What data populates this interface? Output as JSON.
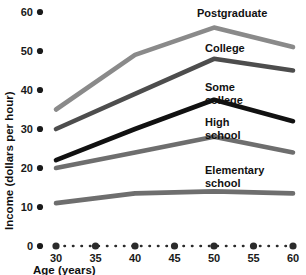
{
  "chart_data": {
    "type": "line",
    "title": "",
    "xlabel": "Age (years)",
    "ylabel": "Income (dollars per hour)",
    "x": [
      30,
      35,
      40,
      45,
      50,
      55,
      60
    ],
    "xticklabels": [
      "30",
      "35",
      "40",
      "45",
      "50",
      "55",
      "60"
    ],
    "yticklabels": [
      "0",
      "10",
      "20",
      "30",
      "40",
      "50",
      "60"
    ],
    "yticks": [
      0,
      10,
      20,
      30,
      40,
      50,
      60
    ],
    "xlim": [
      30,
      60
    ],
    "ylim": [
      0,
      60
    ],
    "grid": false,
    "legend_position": "inline-right-of-curve",
    "series": [
      {
        "name": "Postgraduate",
        "label": "Postgraduate",
        "color": "#8a8a8a",
        "x": [
          30,
          40,
          50,
          60
        ],
        "values": [
          35,
          49,
          56,
          51
        ]
      },
      {
        "name": "College",
        "label": "College",
        "color": "#4d4d4d",
        "x": [
          30,
          40,
          50,
          60
        ],
        "values": [
          30,
          39,
          48,
          45
        ]
      },
      {
        "name": "Some college",
        "label": "Some college",
        "color": "#111111",
        "x": [
          30,
          40,
          50,
          60
        ],
        "values": [
          22,
          30,
          37.5,
          32
        ]
      },
      {
        "name": "High school",
        "label": "High school",
        "color": "#6e6e6e",
        "x": [
          30,
          40,
          50,
          60
        ],
        "values": [
          20,
          24,
          28,
          24
        ]
      },
      {
        "name": "Elementary school",
        "label": "Elementary school",
        "color": "#6e6e6e",
        "x": [
          30,
          40,
          50,
          60
        ],
        "values": [
          11,
          13.5,
          14,
          13.5
        ]
      }
    ],
    "annotations": [
      {
        "text": "Postgraduate",
        "line1": "Postgraduate",
        "line2": ""
      },
      {
        "text": "College",
        "line1": "College",
        "line2": ""
      },
      {
        "text": "Some college",
        "line1": "Some",
        "line2": "college"
      },
      {
        "text": "High school",
        "line1": "High",
        "line2": "school"
      },
      {
        "text": "Elementary school",
        "line1": "Elementary",
        "line2": "school"
      }
    ]
  },
  "axes": {
    "x_title": "Age (years)",
    "y_title": "Income (dollars per hour)",
    "x_ticks": [
      "30",
      "35",
      "40",
      "45",
      "50",
      "55",
      "60"
    ],
    "y_ticks": [
      "60",
      "50",
      "40",
      "30",
      "20",
      "10",
      "0"
    ]
  }
}
